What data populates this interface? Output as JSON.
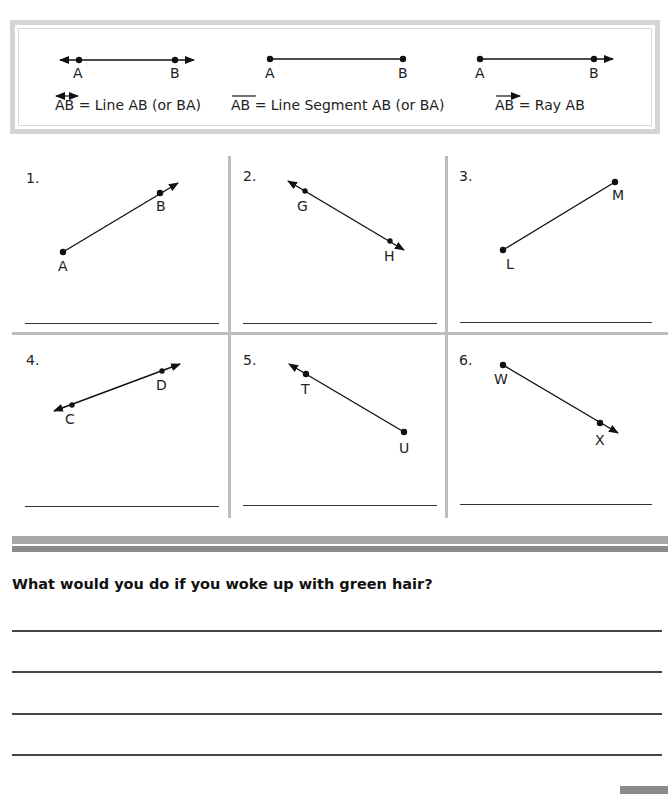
{
  "legend": {
    "items": [
      {
        "notation": "AB",
        "symbol": "line",
        "text": "= Line AB (or BA)",
        "point_a": "A",
        "point_b": "B"
      },
      {
        "notation": "AB",
        "symbol": "segment",
        "text": "= Line Segment AB (or BA)",
        "point_a": "A",
        "point_b": "B"
      },
      {
        "notation": "AB",
        "symbol": "ray",
        "text": "= Ray AB",
        "point_a": "A",
        "point_b": "B"
      }
    ]
  },
  "problems": [
    {
      "number": "1.",
      "p1": "A",
      "p2": "B",
      "type": "ray"
    },
    {
      "number": "2.",
      "p1": "G",
      "p2": "H",
      "type": "line"
    },
    {
      "number": "3.",
      "p1": "L",
      "p2": "M",
      "type": "segment"
    },
    {
      "number": "4.",
      "p1": "C",
      "p2": "D",
      "type": "line"
    },
    {
      "number": "5.",
      "p1": "T",
      "p2": "U",
      "type": "ray"
    },
    {
      "number": "6.",
      "p1": "W",
      "p2": "X",
      "type": "ray"
    }
  ],
  "writing": {
    "prompt": "What would you do if you woke up with green hair?",
    "line_count": 4
  },
  "colors": {
    "border": "#d4d4d4",
    "divider": "#bdbdbd",
    "stripe_light": "#a8a8a8",
    "stripe_dark": "#8a8a8a",
    "ink": "#1a1a1a"
  }
}
